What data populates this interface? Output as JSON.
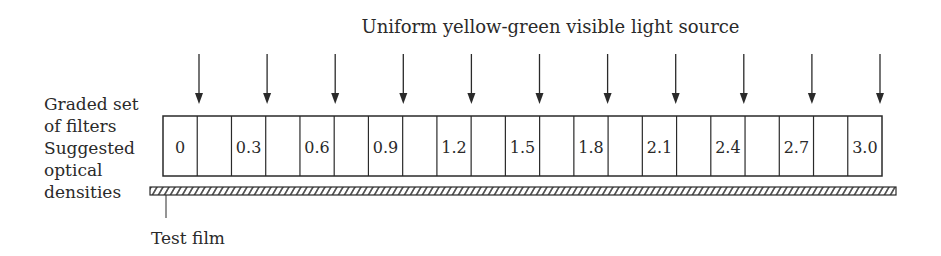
{
  "title": "Uniform yellow-green visible light source",
  "left_labels": {
    "line1": "Graded set",
    "line2": "of filters",
    "line3": "Suggested",
    "line4": "optical",
    "line5": "densities"
  },
  "film_label": "Test film",
  "filters": [
    "0",
    "0.3",
    "0.6",
    "0.9",
    "1.2",
    "1.5",
    "1.8",
    "2.1",
    "2.4",
    "2.7",
    "3.0"
  ],
  "arrow_count": 11,
  "colors": {
    "ink": "#2a2a2a",
    "background": "#ffffff"
  }
}
